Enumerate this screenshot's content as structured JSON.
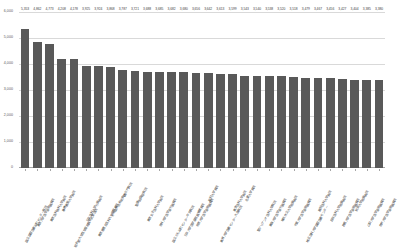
{
  "chart_data": {
    "type": "bar",
    "title": "",
    "xlabel": "",
    "ylabel": "",
    "ylim": [
      0,
      6000
    ],
    "grid": true,
    "legend": false,
    "bar_color": "#595959",
    "yticks": [
      "0",
      "1,000",
      "2,000",
      "3,000",
      "4,000",
      "5,000",
      "6,000"
    ],
    "ytick_values": [
      0,
      1000,
      2000,
      3000,
      4000,
      5000,
      6000
    ],
    "categories": [
      "国立国際医療研究センター病院",
      "東京大学医学部附属病院",
      "東京医科歯科大学病院",
      "慶應義塾大学病院",
      "順天堂大学医学部附属順天堂医院",
      "日本医科大学付属病院",
      "東京慈恵会医科大学附属病院",
      "がん研究会有明病院",
      "虎の門病院",
      "聖路加国際病院",
      "東京女子医科大学病院",
      "杏林大学医学部付属病院",
      "国立がん研究センター中央病院",
      "日本大学医学部附属板橋病院",
      "帝京大学医学部附属病院",
      "昭和大学病院",
      "東邦大学医療センター大森病院",
      "東京医科大学病院",
      "北里大学病院",
      "聖マリアンナ医科大学病院",
      "東海大学医学部付属病院",
      "横浜市立大学附属病院",
      "千葉大学医学部附属病院",
      "埼玉医科大学国際医療センター",
      "獨協医科大学病院",
      "自治医科大学附属病院",
      "群馬大学医学部附属病院",
      "筑波大学附属病院",
      "山梨大学医学部附属病院",
      "信州大学医学部附属病院"
    ],
    "values": [
      5353,
      4862,
      4773,
      4208,
      4178,
      3925,
      3924,
      3868,
      3787,
      3721,
      3688,
      3685,
      3682,
      3680,
      3656,
      3642,
      3613,
      3599,
      3543,
      3540,
      3538,
      3520,
      3518,
      3479,
      3467,
      3456,
      3427,
      3404,
      3385,
      3380
    ],
    "value_labels": [
      "5,353",
      "4,862",
      "4,773",
      "4,208",
      "4,178",
      "3,925",
      "3,924",
      "3,868",
      "3,787",
      "3,721",
      "3,688",
      "3,685",
      "3,682",
      "3,680",
      "3,656",
      "3,642",
      "3,613",
      "3,599",
      "3,543",
      "3,540",
      "3,538",
      "3,520",
      "3,518",
      "3,479",
      "3,467",
      "3,456",
      "3,427",
      "3,404",
      "3,385",
      "3,380"
    ]
  }
}
